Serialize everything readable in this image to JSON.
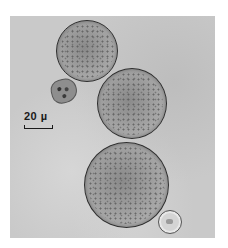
{
  "image": {
    "type": "micrograph",
    "description": "Light micrograph of three large round granular cells, one small irregular cell and one small ring-shaped cell",
    "background_color": "#c9c9c9"
  },
  "scale_bar": {
    "label": "20 µ"
  },
  "objects": [
    {
      "name": "large-cell-top",
      "shape": "circle"
    },
    {
      "name": "large-cell-middle",
      "shape": "circle"
    },
    {
      "name": "large-cell-bottom",
      "shape": "circle"
    },
    {
      "name": "small-irregular-cell",
      "shape": "irregular"
    },
    {
      "name": "small-ring-cell",
      "shape": "ring"
    }
  ]
}
